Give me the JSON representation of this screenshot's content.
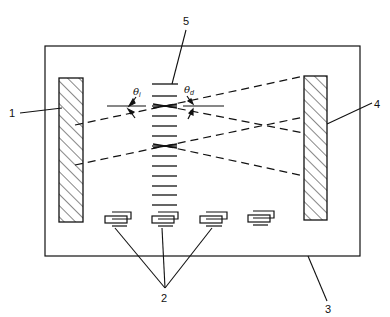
{
  "diagram": {
    "type": "schematic",
    "labels": {
      "callout_1": "1",
      "callout_2": "2",
      "callout_3": "3",
      "callout_4": "4",
      "callout_5": "5",
      "theta_i_symbol": "θ",
      "theta_i_sub": "i",
      "theta_d_symbol": "θ",
      "theta_d_sub": "d"
    },
    "components": [
      {
        "id": "1",
        "name": "left hatched reflector"
      },
      {
        "id": "2",
        "name": "transducers (4 elements, 3 called out)"
      },
      {
        "id": "3",
        "name": "substrate / enclosure"
      },
      {
        "id": "4",
        "name": "right hatched reflector"
      },
      {
        "id": "5",
        "name": "grating"
      }
    ],
    "angles": [
      "theta_i (incidence)",
      "theta_d (diffraction)"
    ],
    "grating_line_count": 13,
    "transducer_count": 4
  }
}
